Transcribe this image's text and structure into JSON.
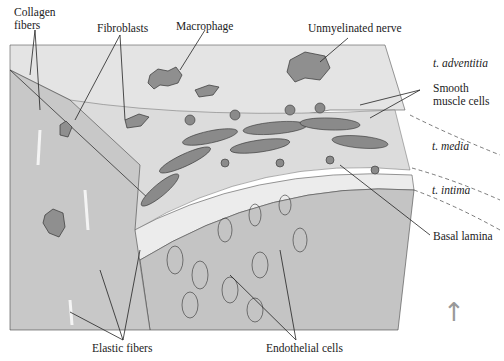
{
  "figure": {
    "labels": {
      "collagen_fibers_1": "Collagen",
      "collagen_fibers_2": "fibers",
      "fibroblasts": "Fibroblasts",
      "macrophage": "Macrophage",
      "unmyelinated_nerve": "Unmyelinated nerve",
      "adventitia": "t. adventitia",
      "smooth_muscle_1": "Smooth",
      "smooth_muscle_2": "muscle cells",
      "media": "t. media",
      "intima": "t. intima",
      "basal_lamina": "Basal lamina",
      "elastic_fibers": "Elastic fibers",
      "endothelial_cells": "Endothelial cells"
    },
    "arrow": "↑",
    "colors": {
      "background": "#ffffff",
      "adventitia_fill": "#e4e4e4",
      "side_panel_fill": "#c8c8c8",
      "lumen_fill": "#c4c4c4",
      "cell_fill": "#8a8a8a",
      "line": "#222222",
      "arrow": "#999999"
    }
  }
}
